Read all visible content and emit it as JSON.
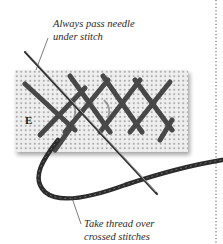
{
  "figure": {
    "step_letter": "E",
    "annotations": [
      {
        "id": "top",
        "lines": [
          "Always pass needle",
          "under stitch"
        ]
      },
      {
        "id": "bottom",
        "lines": [
          "Take thread over",
          "crossed stitches"
        ]
      }
    ],
    "colors": {
      "background": "#ffffff",
      "fabric": "#ececec",
      "fabric_holes": "#9a9a9a",
      "thread": "#2b2b2b",
      "needle": "#555555",
      "text": "#2a2a2a",
      "divider": "#555555"
    }
  }
}
